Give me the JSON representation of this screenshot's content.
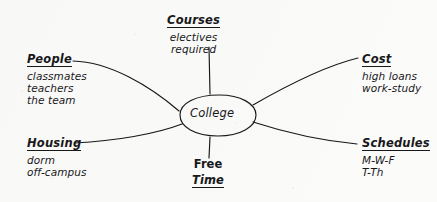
{
  "diagram": {
    "type": "mind-map",
    "center": {
      "label": "College",
      "shape": "ellipse"
    },
    "branches": [
      {
        "id": "people",
        "title": "People",
        "details": [
          "classmates",
          "teachers",
          "the team"
        ],
        "position": "left-upper",
        "connector": "curve"
      },
      {
        "id": "housing",
        "title": "Housing",
        "details": [
          "dorm",
          "off-campus"
        ],
        "position": "left-lower",
        "connector": "curve"
      },
      {
        "id": "courses",
        "title": "Courses",
        "details": [
          "electives",
          "required"
        ],
        "position": "top",
        "connector": "straight"
      },
      {
        "id": "cost",
        "title": "Cost",
        "details": [
          "high loans",
          "work-study"
        ],
        "position": "right-upper",
        "connector": "curve"
      },
      {
        "id": "schedules",
        "title": "Schedules",
        "details": [
          "M-W-F",
          "T-Th"
        ],
        "position": "right-lower",
        "connector": "curve"
      },
      {
        "id": "free-time",
        "title_line1": "Free",
        "title_line2": "Time",
        "details": [],
        "position": "bottom",
        "connector": "straight"
      }
    ],
    "colors": {
      "ink": "#18181a",
      "paper": "#fbfbfa"
    }
  }
}
